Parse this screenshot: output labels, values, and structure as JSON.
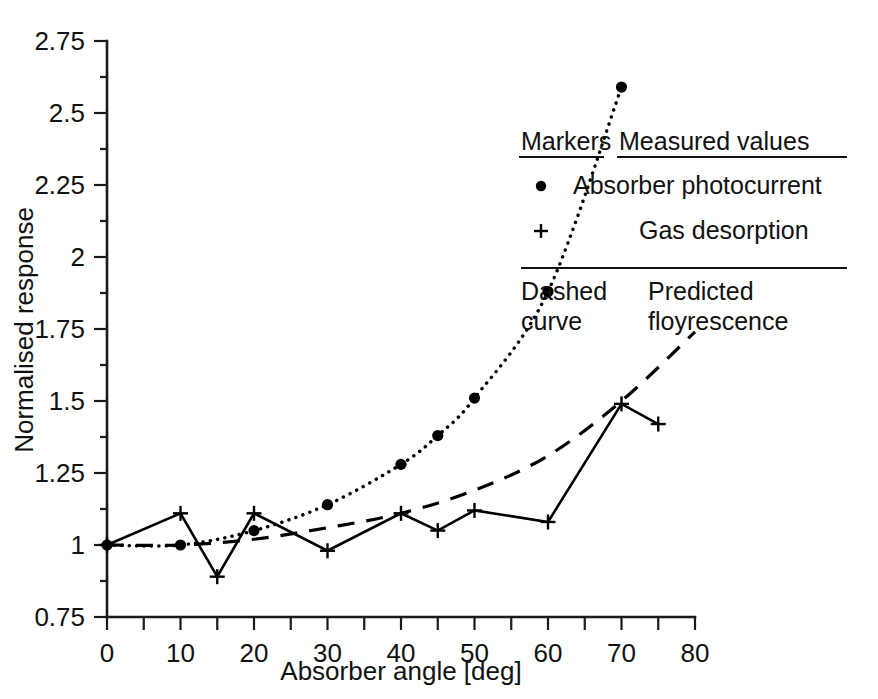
{
  "chart_data": {
    "type": "line",
    "title": "",
    "xlabel": "Absorber angle [deg]",
    "ylabel": "Normalised response",
    "xlim": [
      0,
      80
    ],
    "ylim": [
      0.75,
      2.75
    ],
    "grid": false,
    "x_ticks": [
      "0",
      "10",
      "20",
      "30",
      "40",
      "50",
      "60",
      "70",
      "80"
    ],
    "x_tick_values": [
      0,
      10,
      20,
      30,
      40,
      50,
      60,
      70,
      80
    ],
    "x_minor_tick_values": [
      5,
      15,
      25,
      35,
      45,
      55,
      65,
      75
    ],
    "y_ticks": [
      "0.75",
      "1",
      "1.25",
      "1.5",
      "1.75",
      "2",
      "2.25",
      "2.5",
      "2.75"
    ],
    "y_tick_values": [
      0.75,
      1,
      1.25,
      1.5,
      1.75,
      2,
      2.25,
      2.5,
      2.75
    ],
    "y_minor_tick_values": [
      0.875,
      1.125,
      1.375,
      1.625,
      1.875,
      2.125,
      2.375,
      2.625
    ],
    "legend_position": "upper-right-inside",
    "series": [
      {
        "name": "Absorber photocurrent",
        "marker": "dot",
        "line_style": "dotted",
        "x": [
          0,
          10,
          20,
          30,
          40,
          45,
          50,
          60,
          70
        ],
        "values": [
          1.0,
          1.0,
          1.05,
          1.14,
          1.28,
          1.38,
          1.51,
          1.88,
          2.59
        ]
      },
      {
        "name": "Gas desorption",
        "marker": "plus",
        "line_style": "solid",
        "x": [
          0,
          10,
          15,
          20,
          30,
          40,
          45,
          50,
          60,
          70,
          75
        ],
        "values": [
          1.0,
          1.11,
          0.89,
          1.11,
          0.98,
          1.11,
          1.05,
          1.12,
          1.08,
          1.49,
          1.42
        ]
      },
      {
        "name": "Predicted floyrescence",
        "marker": "none",
        "line_style": "dashed",
        "x": [
          0,
          10,
          20,
          30,
          40,
          50,
          60,
          70,
          80
        ],
        "values": [
          1.0,
          1.0,
          1.02,
          1.06,
          1.11,
          1.19,
          1.31,
          1.5,
          1.74
        ]
      }
    ]
  },
  "legend": {
    "header_markers": "Markers",
    "header_measured": "Measured values",
    "entries": [
      {
        "marker": "dot",
        "label": "Absorber photocurrent"
      },
      {
        "marker": "plus",
        "label": "Gas desorption"
      }
    ],
    "footer_left_line1": "Dashed",
    "footer_left_line2": "curve",
    "footer_right_line1": "Predicted",
    "footer_right_line2": "floyrescence"
  },
  "colors": {
    "ink": "#000000",
    "text": "#111111",
    "background": "#ffffff"
  }
}
